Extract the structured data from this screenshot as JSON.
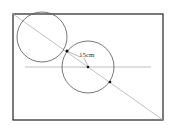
{
  "diagram": {
    "label": "15cm",
    "colors": {
      "frame": "#222222",
      "line": "#b0b0b0",
      "circle": "#555555",
      "dot": "#111111"
    }
  }
}
